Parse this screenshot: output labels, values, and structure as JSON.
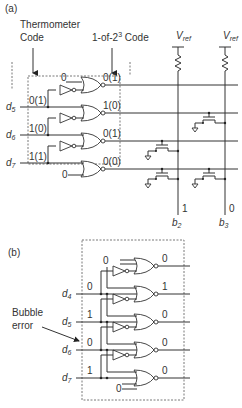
{
  "part_a": {
    "label": "(a)",
    "thermometer_label_1": "Thermometer",
    "thermometer_label_2": "Code",
    "one_of_label": "1-of-2",
    "one_of_sup": "3",
    "one_of_suffix": " Code",
    "vref": "V",
    "vref_sub": "ref",
    "inputs": [
      {
        "name": "d",
        "sub": "5",
        "value": "0(1)"
      },
      {
        "name": "d",
        "sub": "6",
        "value": "1(0)"
      },
      {
        "name": "d",
        "sub": "7",
        "value": "1(1)"
      }
    ],
    "top_const": "0",
    "bottom_const": "0",
    "outputs": [
      "0(1)",
      "1(0)",
      "0(1)",
      "0(0)"
    ],
    "bit_values": [
      "1",
      "0"
    ],
    "bits": [
      {
        "name": "b",
        "sub": "2"
      },
      {
        "name": "b",
        "sub": "3"
      }
    ]
  },
  "part_b": {
    "label": "(b)",
    "top_const": "0",
    "bottom_const": "0",
    "inputs": [
      {
        "name": "d",
        "sub": "4",
        "value": "0"
      },
      {
        "name": "d",
        "sub": "5",
        "value": "1"
      },
      {
        "name": "d",
        "sub": "6",
        "value": "0"
      },
      {
        "name": "d",
        "sub": "7",
        "value": "1"
      }
    ],
    "outputs": [
      "0",
      "1",
      "0",
      "0",
      "0"
    ],
    "annotation_1": "Bubble",
    "annotation_2": "error"
  }
}
